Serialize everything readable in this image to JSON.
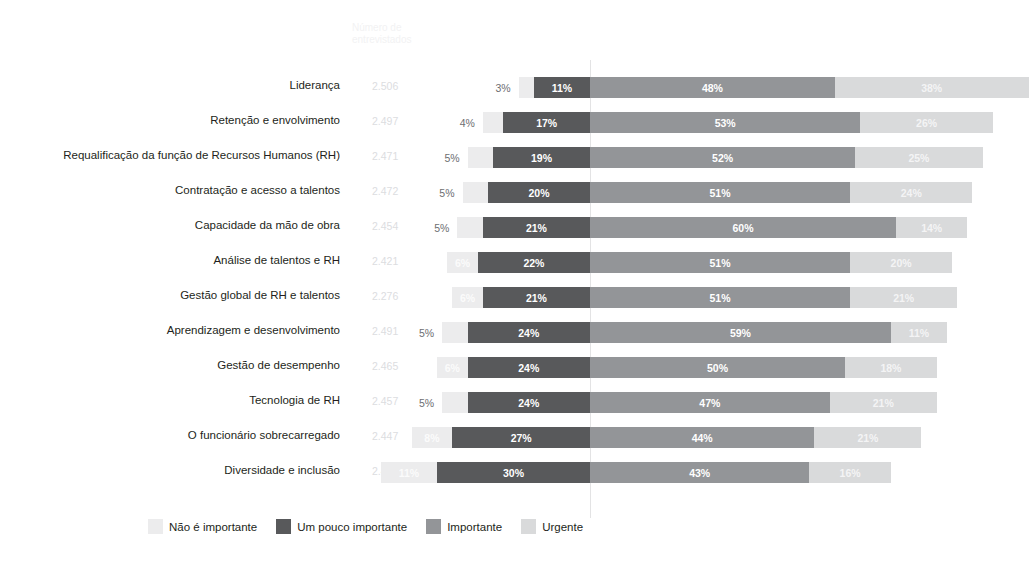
{
  "header": {
    "count_column_title": "Número de\nentrevistados"
  },
  "legend": {
    "items": [
      {
        "label": "Não é importante",
        "color": "#ececed"
      },
      {
        "label": "Um pouco importante",
        "color": "#58595b"
      },
      {
        "label": "Importante",
        "color": "#939598"
      },
      {
        "label": "Urgente",
        "color": "#d9dadb"
      }
    ]
  },
  "chart_data": {
    "type": "bar",
    "subtype": "diverging-stacked-bar",
    "title": "",
    "xlabel": "",
    "ylabel": "",
    "grid": true,
    "legend_position": "bottom",
    "axis_anchor_series": "Um pouco importante",
    "categories": [
      "Liderança",
      "Retenção e envolvimento",
      "Requalificação da função de Recursos Humanos (RH)",
      "Contratação e acesso a talentos",
      "Capacidade da mão de obra",
      "Análise de talentos e RH",
      "Gestão global de RH e talentos",
      "Aprendizagem e desenvolvimento",
      "Gestão de desempenho",
      "Tecnologia de RH",
      "O funcionário sobrecarregado",
      "Diversidade e inclusão"
    ],
    "respondents": [
      "2.506",
      "2.497",
      "2.471",
      "2.472",
      "2.454",
      "2.421",
      "2.276",
      "2.491",
      "2.465",
      "2.457",
      "2.447",
      "2.414"
    ],
    "series": [
      {
        "name": "Não é importante",
        "color": "#ececed",
        "values": [
          3,
          4,
          5,
          5,
          5,
          6,
          6,
          5,
          6,
          5,
          8,
          11
        ],
        "labels": [
          "3%",
          "4%",
          "5%",
          "5%",
          "5%",
          "6%",
          "6%",
          "5%",
          "6%",
          "5%",
          "8%",
          "11%"
        ]
      },
      {
        "name": "Um pouco importante",
        "color": "#58595b",
        "values": [
          11,
          17,
          19,
          20,
          21,
          22,
          21,
          24,
          24,
          24,
          27,
          30
        ],
        "labels": [
          "11%",
          "17%",
          "19%",
          "20%",
          "21%",
          "22%",
          "21%",
          "24%",
          "24%",
          "24%",
          "27%",
          "30%"
        ]
      },
      {
        "name": "Importante",
        "color": "#939598",
        "values": [
          48,
          53,
          52,
          51,
          60,
          51,
          51,
          59,
          50,
          47,
          44,
          43
        ],
        "labels": [
          "48%",
          "53%",
          "52%",
          "51%",
          "60%",
          "51%",
          "51%",
          "59%",
          "50%",
          "47%",
          "44%",
          "43%"
        ]
      },
      {
        "name": "Urgente",
        "color": "#d9dadb",
        "values": [
          38,
          26,
          25,
          24,
          14,
          20,
          21,
          11,
          18,
          21,
          21,
          16
        ],
        "labels": [
          "38%",
          "26%",
          "25%",
          "24%",
          "14%",
          "20%",
          "21%",
          "11%",
          "18%",
          "21%",
          "21%",
          "16%"
        ]
      }
    ]
  }
}
